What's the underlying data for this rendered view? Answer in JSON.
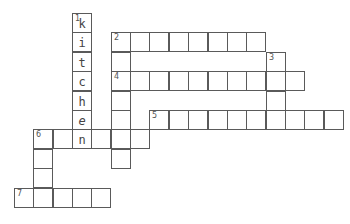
{
  "puzzle": {
    "type": "crossword",
    "cell_size": 19.35,
    "origin": {
      "x": 14,
      "y": 13
    },
    "grid_color": "#5a5a5a",
    "words": [
      {
        "number": "1",
        "direction": "down",
        "row": 0,
        "col": 3,
        "length": 7,
        "answer": "kitchen",
        "letters": [
          "k",
          "i",
          "t",
          "c",
          "h",
          "e",
          "n"
        ]
      },
      {
        "number": "2",
        "direction": "across",
        "row": 1,
        "col": 5,
        "length": 8,
        "letters": []
      },
      {
        "number": "3",
        "direction": "down",
        "row": 2,
        "col": 13,
        "length": 4,
        "letters": []
      },
      {
        "number": "4",
        "direction": "across",
        "row": 3,
        "col": 5,
        "length": 10,
        "letters": []
      },
      {
        "number": "5",
        "direction": "across",
        "row": 5,
        "col": 7,
        "length": 10,
        "letters": []
      },
      {
        "number": "6",
        "direction": "down",
        "row": 6,
        "col": 1,
        "length": 4,
        "letters": []
      },
      {
        "number": "",
        "direction": "across",
        "row": 6,
        "col": 1,
        "length": 6,
        "letters": []
      },
      {
        "number": "",
        "direction": "down",
        "row": 1,
        "col": 5,
        "length": 7,
        "letters": []
      },
      {
        "number": "7",
        "direction": "across",
        "row": 9,
        "col": 0,
        "length": 5,
        "letters": []
      }
    ]
  }
}
